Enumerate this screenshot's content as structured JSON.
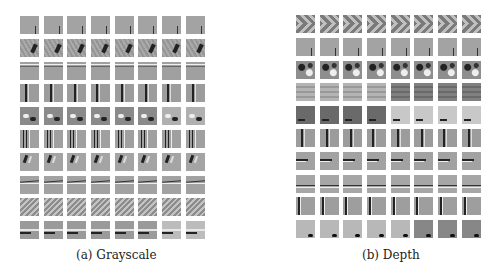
{
  "figure": {
    "panels": [
      {
        "id": "a",
        "caption": "(a) Grayscale",
        "rows": 10,
        "cols": 8,
        "row_patterns": [
          "corner-edge",
          "diagonal-blob",
          "horizontal-top",
          "vertical-line",
          "blob-pairs",
          "vertical-double",
          "diagonal-strokes",
          "horizontal-line",
          "diagonal-stripes",
          "dark-horizontal-bottom"
        ]
      },
      {
        "id": "b",
        "caption": "(b) Depth",
        "rows": 10,
        "cols": 8,
        "row_patterns": [
          "chevron",
          "corner-edge",
          "checker-blobs",
          "horizontal-bands",
          "dark-light-split",
          "vertical-line",
          "dark-horizontal",
          "horizontal-line-mid",
          "vertical-left",
          "corner-blob"
        ]
      }
    ]
  }
}
